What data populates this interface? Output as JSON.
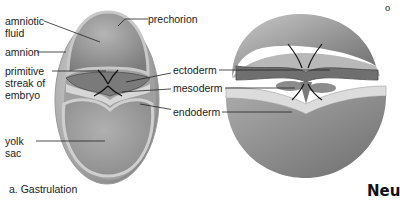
{
  "figure": {
    "panel_a": {
      "caption": "a. Gastrulation",
      "labels": {
        "amniotic_fluid_1": "amniotic",
        "amniotic_fluid_2": "fluid",
        "amnion": "amnion",
        "primitive_streak_1": "primitive",
        "primitive_streak_2": "streak of",
        "primitive_streak_3": "embryo",
        "yolk_sac_1": "yolk",
        "yolk_sac_2": "sac",
        "prechorion": "prechorion"
      }
    },
    "panel_b": {
      "labels": {
        "ectoderm": "ectoderm",
        "mesoderm": "mesoderm",
        "endoderm": "endoderm"
      },
      "partial_text_top": "o",
      "partial_text_bottom": "Neu"
    },
    "colors": {
      "background": "#ffffff",
      "text": "#1a1a1a",
      "shell_light": "#cfcfcf",
      "shell_dark": "#8a8a8a",
      "ectoderm": "#6f6f6f",
      "endoderm": "#dcdcdc"
    }
  }
}
